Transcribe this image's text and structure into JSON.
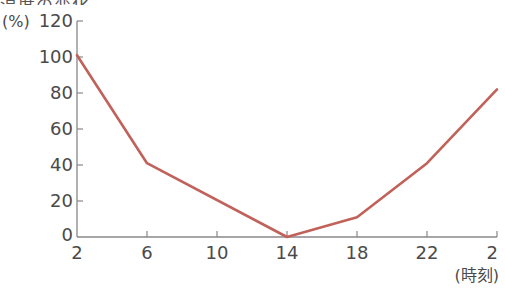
{
  "header": {
    "cutoff_text": "温度の変化"
  },
  "chart_data": {
    "type": "line",
    "title": "",
    "xlabel": "(時刻)",
    "ylabel": "(%)",
    "x": [
      "2",
      "6",
      "10",
      "14",
      "18",
      "22",
      "2"
    ],
    "yticks": [
      0,
      20,
      40,
      60,
      80,
      100,
      120
    ],
    "ylim": [
      0,
      120
    ],
    "grid": false,
    "series": [
      {
        "name": "series-1",
        "color": "#c0625a",
        "points": [
          {
            "x": "2",
            "y": 101
          },
          {
            "x": "6",
            "y": 41
          },
          {
            "x": "14",
            "y": 0
          },
          {
            "x": "18",
            "y": 11
          },
          {
            "x": "22",
            "y": 41
          },
          {
            "x": "2",
            "y": 82
          }
        ]
      }
    ]
  },
  "colors": {
    "axis": "#888888",
    "line": "#c0625a",
    "text": "#4a4a4a"
  }
}
